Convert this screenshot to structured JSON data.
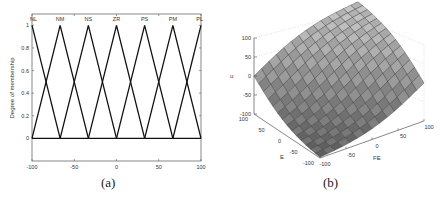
{
  "chart_data": [
    {
      "type": "line",
      "panel_label": "(a)",
      "title": "",
      "xlabel": "E,FE,u",
      "ylabel": "Degree of membership",
      "xlim": [
        -100,
        100
      ],
      "ylim": [
        -0.2,
        1.1
      ],
      "xticks": [
        -100,
        -50,
        0,
        50,
        100
      ],
      "yticks": [
        0,
        0.2,
        0.4,
        0.6,
        0.8,
        1
      ],
      "grid": false,
      "legend": "none",
      "annotations": [
        "NL",
        "NM",
        "NS",
        "ZR",
        "PS",
        "PM",
        "PL"
      ],
      "series": [
        {
          "name": "NL",
          "x": [
            -100,
            -66.7
          ],
          "values": [
            1,
            0
          ]
        },
        {
          "name": "NM",
          "x": [
            -100,
            -66.7,
            -33.3
          ],
          "values": [
            0,
            1,
            0
          ]
        },
        {
          "name": "NS",
          "x": [
            -66.7,
            -33.3,
            0
          ],
          "values": [
            0,
            1,
            0
          ]
        },
        {
          "name": "ZR",
          "x": [
            -33.3,
            0,
            33.3
          ],
          "values": [
            0,
            1,
            0
          ]
        },
        {
          "name": "PS",
          "x": [
            0,
            33.3,
            66.7
          ],
          "values": [
            0,
            1,
            0
          ]
        },
        {
          "name": "PM",
          "x": [
            33.3,
            66.7,
            100
          ],
          "values": [
            0,
            1,
            0
          ]
        },
        {
          "name": "PL",
          "x": [
            66.7,
            100
          ],
          "values": [
            0,
            1
          ]
        }
      ]
    },
    {
      "type": "surface",
      "panel_label": "(b)",
      "title": "",
      "xlabel": "FE",
      "ylabel": "E",
      "zlabel": "u",
      "xlim": [
        -100,
        100
      ],
      "ylim": [
        -100,
        100
      ],
      "zlim": [
        -100,
        100
      ],
      "xticks": [
        -100,
        -50,
        0,
        50,
        100
      ],
      "yticks": [
        -100,
        -50,
        0,
        50,
        100
      ],
      "zticks": [
        -100,
        -50,
        0,
        50,
        100
      ],
      "grid": true,
      "legend": "none",
      "description": "Fuzzy control surface u(E,FE): rises from -100 at (E=-100,FE=-100) to 100 at (E=100,FE=100), gray shaded mesh"
    }
  ],
  "captions": {
    "a": "(a)",
    "b": "(b)"
  },
  "ticks_a": {
    "x": [
      "-100",
      "-50",
      "0",
      "50",
      "100"
    ],
    "y": [
      "0",
      "0.2",
      "0.4",
      "0.6",
      "0.8",
      "1"
    ]
  },
  "ticks_b": {
    "z": [
      "100",
      "50",
      "0",
      "-50",
      "-100"
    ],
    "e": [
      "100",
      "50",
      "0",
      "-50",
      "-100"
    ],
    "fe": [
      "-100",
      "-50",
      "0",
      "50",
      "100"
    ]
  }
}
